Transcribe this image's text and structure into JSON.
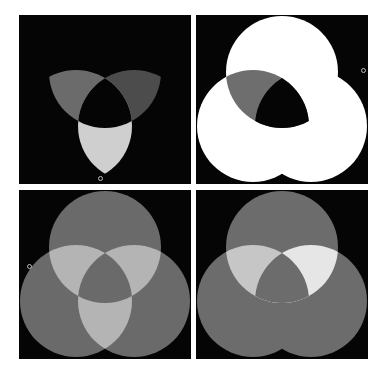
{
  "figure": {
    "background": "#ffffff",
    "panel_background": "#050505",
    "circle_radius": 56,
    "circle_centers": {
      "top": [
        86,
        57
      ],
      "left": [
        57,
        111
      ],
      "right": [
        115,
        111
      ]
    },
    "panels": [
      {
        "id": "top-left",
        "position": [
          19,
          15
        ],
        "regions": {
          "top_left_lens": "#6b6b6b",
          "top_right_lens": "#4c4c4c",
          "left_right_lens": "#cfcfcf",
          "triple_center": "#050505"
        },
        "marker": [
          100,
          178
        ]
      },
      {
        "id": "top-right",
        "position": [
          196,
          15
        ],
        "regions": {
          "union": "#ffffff",
          "top_left_lens": "#6e6e6e",
          "top_left_lens_inside_right": "#050505"
        },
        "marker": [
          363,
          70
        ]
      },
      {
        "id": "bottom-left",
        "position": [
          19,
          190
        ],
        "regions": {
          "circles": "#6a6a6a",
          "pairwise_lenses": "#b4b4b4",
          "triple_center": "#6a6a6a"
        },
        "marker": [
          29,
          266
        ]
      },
      {
        "id": "bottom-right",
        "position": [
          196,
          190
        ],
        "regions": {
          "circles": "#6c6c6c",
          "top_left_lens": "#c6c6c6",
          "top_right_lens": "#e6e6e6",
          "left_right_lens": "#6c6c6c",
          "triple_center": "#6c6c6c"
        }
      }
    ]
  }
}
